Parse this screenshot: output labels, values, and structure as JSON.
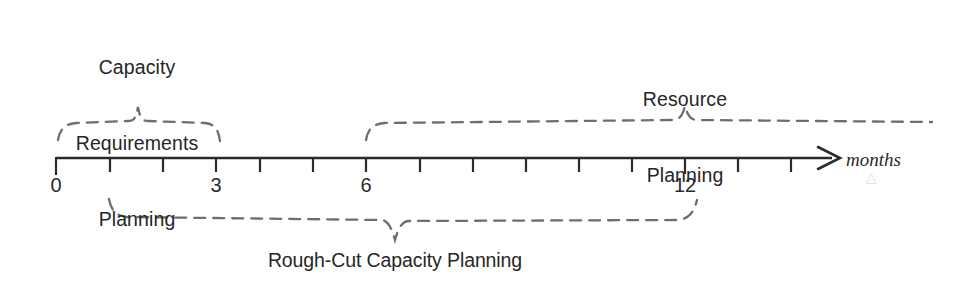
{
  "diagram": {
    "axis": {
      "name": "months-axis",
      "unit_label": "months",
      "unit_label_italic": true,
      "line_color": "#2b2b2b",
      "y": 158,
      "x_start": 56,
      "x_end": 838,
      "arrow": "right-arrow",
      "tick_count": 15,
      "tick_spacing_px": 53,
      "tick_labels": [
        {
          "value": "0",
          "x": 56
        },
        {
          "value": "3",
          "x": 216
        },
        {
          "value": "6",
          "x": 366
        },
        {
          "value": "12",
          "x": 685
        }
      ],
      "ticks_x": [
        56,
        110,
        163,
        216,
        260,
        300,
        366,
        420,
        473,
        526,
        579,
        632,
        685,
        738,
        791
      ]
    },
    "annotations": [
      {
        "name": "capacity-requirements-planning",
        "lines": [
          "Capacity",
          "Requirements",
          "Planning"
        ],
        "text": "Capacity Requirements Planning",
        "position": "above-axis",
        "brace": {
          "name": "brace-capacity-requirements-planning",
          "style": "dashed",
          "orientation": "up",
          "color": "#6e6e6e",
          "x_start": 56,
          "x_end": 221,
          "apex_x": 138,
          "apex_y": 106,
          "baseline_y": 126
        }
      },
      {
        "name": "resource-planning",
        "lines": [
          "Resource",
          "Planning"
        ],
        "text": "Resource Planning",
        "position": "above-axis",
        "brace": {
          "name": "brace-resource-planning",
          "style": "dashed",
          "orientation": "up",
          "color": "#6e6e6e",
          "x_start": 365,
          "x_end": 932,
          "apex_x": 685,
          "apex_y": 106,
          "baseline_y": 124
        }
      },
      {
        "name": "rough-cut-capacity-planning",
        "lines": [
          "Rough-Cut Capacity Planning"
        ],
        "text": "Rough-Cut Capacity Planning",
        "position": "below-axis",
        "brace": {
          "name": "brace-rough-cut-capacity-planning",
          "style": "dashed",
          "orientation": "down",
          "color": "#6e6e6e",
          "x_start": 108,
          "x_end": 698,
          "apex_x": 395,
          "apex_y": 240,
          "baseline_y": 221
        }
      }
    ],
    "colors": {
      "background": "#ffffff",
      "ink": "#2b2b2b",
      "brace": "#6e6e6e"
    }
  }
}
